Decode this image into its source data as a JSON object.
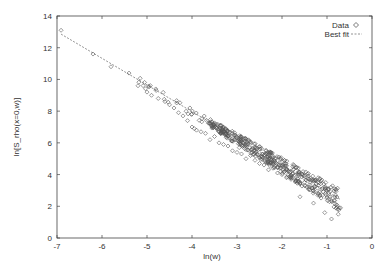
{
  "chart_data": {
    "type": "scatter",
    "title": "",
    "xlabel": "ln(w)",
    "ylabel": "ln[S_rho(x=0,w)]",
    "xlim": [
      -7,
      0
    ],
    "ylim": [
      0,
      14
    ],
    "xticks": [
      -7,
      -6,
      -5,
      -4,
      -3,
      -2,
      -1,
      0
    ],
    "yticks": [
      0,
      2,
      4,
      6,
      8,
      10,
      12,
      14
    ],
    "grid": false,
    "legend_position": "top-right",
    "series": [
      {
        "name": "Data",
        "style": "open-diamond-markers",
        "points": [
          [
            -6.91,
            13.1
          ],
          [
            -6.2,
            11.6
          ],
          [
            -5.8,
            10.8
          ],
          [
            -5.4,
            10.4
          ],
          [
            -5.2,
            9.6
          ],
          [
            -5.0,
            9.2
          ],
          [
            -4.9,
            9.0
          ],
          [
            -4.75,
            8.8
          ],
          [
            -4.6,
            8.6
          ],
          [
            -4.5,
            8.4
          ],
          [
            -4.4,
            8.2
          ],
          [
            -4.3,
            7.9
          ],
          [
            -4.2,
            7.7
          ],
          [
            -4.1,
            7.4
          ],
          [
            -4.0,
            7.0
          ],
          [
            -3.95,
            6.9
          ],
          [
            -3.9,
            6.8
          ],
          [
            -3.8,
            6.7
          ],
          [
            -3.7,
            6.6
          ],
          [
            -3.6,
            6.2
          ],
          [
            -3.5,
            6.4
          ],
          [
            -3.4,
            6.0
          ],
          [
            -3.3,
            5.9
          ],
          [
            -3.2,
            5.8
          ],
          [
            -3.1,
            5.5
          ],
          [
            -3.0,
            5.4
          ],
          [
            -2.95,
            5.7
          ],
          [
            -2.9,
            5.3
          ],
          [
            -2.8,
            5.0
          ],
          [
            -2.7,
            5.2
          ],
          [
            -2.6,
            4.9
          ],
          [
            -2.5,
            4.7
          ],
          [
            -2.4,
            4.6
          ],
          [
            -2.3,
            4.3
          ],
          [
            -2.2,
            4.4
          ],
          [
            -2.1,
            4.1
          ],
          [
            -2.0,
            4.0
          ],
          [
            -1.9,
            3.8
          ],
          [
            -1.8,
            3.7
          ],
          [
            -1.7,
            3.6
          ],
          [
            -1.6,
            3.4
          ],
          [
            -1.5,
            3.3
          ],
          [
            -1.4,
            3.1
          ],
          [
            -1.3,
            3.0
          ],
          [
            -1.2,
            2.8
          ],
          [
            -1.1,
            2.7
          ],
          [
            -1.0,
            2.5
          ],
          [
            -0.9,
            2.3
          ],
          [
            -0.8,
            2.1
          ],
          [
            -0.7,
            1.9
          ],
          [
            -0.75,
            1.5
          ],
          [
            -1.05,
            1.6
          ],
          [
            -0.9,
            1.2
          ],
          [
            -1.3,
            2.2
          ],
          [
            -1.6,
            2.6
          ]
        ]
      },
      {
        "name": "Best fit",
        "style": "dashed-line",
        "slope": -1.68,
        "intercept": 1.25,
        "x_range": [
          -6.91,
          -0.69
        ]
      }
    ]
  },
  "legend": {
    "items": [
      {
        "label": "Data",
        "marker": "diamond"
      },
      {
        "label": "Best fit",
        "marker": "dashed-line"
      }
    ]
  },
  "axes": {
    "x_label": "ln(w)",
    "y_label": "ln[S_rho(x=0,w)]",
    "x_tick_labels": [
      "-7",
      "-6",
      "-5",
      "-4",
      "-3",
      "-2",
      "-1",
      "0"
    ],
    "y_tick_labels": [
      "0",
      "2",
      "4",
      "6",
      "8",
      "10",
      "12",
      "14"
    ]
  },
  "colors": {
    "marker": "#555555",
    "line": "#777777",
    "axis": "#444444"
  }
}
